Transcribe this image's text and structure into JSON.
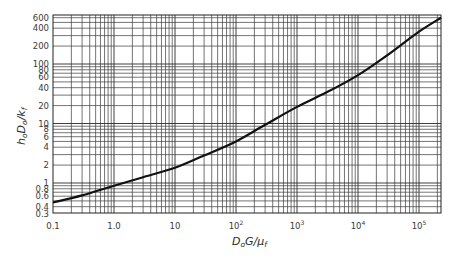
{
  "chart_data": {
    "type": "line",
    "title": "",
    "xlabel": "D_o G / μ_f",
    "ylabel": "h_o D_o / k_f",
    "xscale": "log",
    "yscale": "log",
    "xlim": [
      0.1,
      230000
    ],
    "ylim": [
      0.3,
      680
    ],
    "grid": true,
    "legend": null,
    "x_ticks": [
      {
        "value": 0.1,
        "label": "0.1"
      },
      {
        "value": 1,
        "label": "1.0"
      },
      {
        "value": 10,
        "label": "10"
      },
      {
        "value": 100,
        "label": "10",
        "sup": "2"
      },
      {
        "value": 1000,
        "label": "10",
        "sup": "3"
      },
      {
        "value": 10000,
        "label": "10",
        "sup": "4"
      },
      {
        "value": 100000,
        "label": "10",
        "sup": "5"
      }
    ],
    "y_ticks": [
      {
        "value": 0.3,
        "label": "0.3"
      },
      {
        "value": 0.4,
        "label": "0.4"
      },
      {
        "value": 0.6,
        "label": "0.6"
      },
      {
        "value": 0.8,
        "label": "0.8"
      },
      {
        "value": 1,
        "label": "1"
      },
      {
        "value": 2,
        "label": "2"
      },
      {
        "value": 4,
        "label": "4"
      },
      {
        "value": 6,
        "label": "6"
      },
      {
        "value": 8,
        "label": "8"
      },
      {
        "value": 10,
        "label": "10"
      },
      {
        "value": 20,
        "label": "20"
      },
      {
        "value": 40,
        "label": "40"
      },
      {
        "value": 60,
        "label": "60"
      },
      {
        "value": 80,
        "label": "80"
      },
      {
        "value": 100,
        "label": "100"
      },
      {
        "value": 200,
        "label": "200"
      },
      {
        "value": 400,
        "label": "400"
      },
      {
        "value": 600,
        "label": "600"
      }
    ],
    "series": [
      {
        "name": "h_o D_o / k_f vs D_o G / μ_f",
        "x": [
          0.1,
          0.3,
          1,
          3,
          10,
          30,
          100,
          300,
          1000,
          3000,
          10000,
          30000,
          100000,
          230000
        ],
        "y": [
          0.47,
          0.62,
          0.9,
          1.25,
          1.8,
          2.9,
          5.0,
          9.5,
          19,
          33,
          65,
          140,
          350,
          600
        ]
      }
    ]
  },
  "labels": {
    "ylabel_main": "h",
    "ylabel_sub1": "o",
    "ylabel_mid": "D",
    "ylabel_sub2": "o",
    "ylabel_end": "/k",
    "ylabel_sub3": "f",
    "xlabel_main": "D",
    "xlabel_sub1": "o",
    "xlabel_mid": "G/μ",
    "xlabel_sub2": "f"
  }
}
